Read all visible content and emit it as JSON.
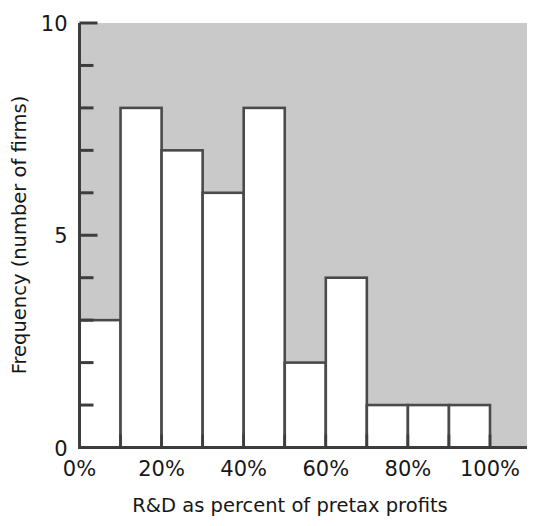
{
  "chart_data": {
    "type": "bar",
    "title": "",
    "subtitle": "",
    "xlabel": "R&D as percent of pretax profits",
    "ylabel": "Frequency (number of firms)",
    "categories": [
      "0-10%",
      "10-20%",
      "20-30%",
      "30-40%",
      "40-50%",
      "50-60%",
      "60-70%",
      "70-80%",
      "80-90%",
      "90-100%"
    ],
    "bin_edges": [
      0,
      10,
      20,
      30,
      40,
      50,
      60,
      70,
      80,
      90,
      100
    ],
    "values": [
      3,
      8,
      7,
      6,
      8,
      2,
      4,
      1,
      1,
      1
    ],
    "xlim": [
      0,
      100
    ],
    "ylim": [
      0,
      10
    ],
    "x_tick_labels": [
      "0%",
      "20%",
      "40%",
      "60%",
      "80%",
      "100%"
    ],
    "x_tick_values": [
      0,
      20,
      40,
      60,
      80,
      100
    ],
    "y_tick_labels": [
      "0",
      "5",
      "10"
    ],
    "y_tick_values": [
      0,
      5,
      10
    ],
    "y_minor_ticks": [
      1,
      2,
      3,
      4,
      6,
      7,
      8,
      9
    ],
    "grid": false,
    "legend": "none",
    "plot_background_color": "#c9c9c9",
    "bar_fill_color": "#ffffff",
    "bar_edge_color": "#4a4a4a",
    "axis_color": "#3d3d3d",
    "text_color": "#171717"
  },
  "axes": {
    "x_title": "R&D as percent of pretax profits",
    "y_title": "Frequency (number of firms)",
    "x_labels": [
      "0%",
      "20%",
      "40%",
      "60%",
      "80%",
      "100%"
    ],
    "y_labels": [
      "0",
      "5",
      "10"
    ]
  }
}
